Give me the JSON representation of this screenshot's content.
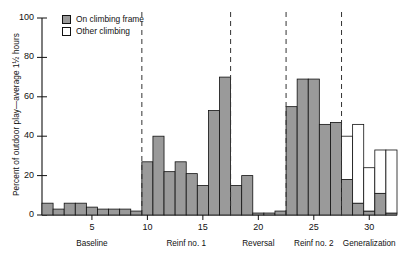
{
  "chart_data": {
    "type": "bar",
    "title": "",
    "xlabel": "",
    "ylabel": "Percent of outdoor play—average 1½ hours",
    "ylim": [
      0,
      100
    ],
    "yticks": [
      0,
      20,
      40,
      60,
      80,
      100
    ],
    "xticks": [
      5,
      10,
      15,
      20,
      25,
      30
    ],
    "xlim": [
      0.5,
      32.5
    ],
    "grid": false,
    "legend_position": "top-left",
    "stacked": true,
    "series": [
      {
        "name": "On climbing frame",
        "color": "#9a9a9a",
        "values": [
          6,
          3,
          6,
          6,
          4,
          3,
          3,
          3,
          2,
          27,
          40,
          22,
          27,
          21,
          15,
          53,
          70,
          15,
          20,
          1,
          1,
          2,
          55,
          69,
          69,
          46,
          47,
          18,
          6,
          2,
          11,
          1
        ]
      },
      {
        "name": "Other climbing",
        "color": "#ffffff",
        "values": [
          0,
          0,
          0,
          0,
          0,
          0,
          0,
          0,
          0,
          0,
          0,
          0,
          0,
          0,
          0,
          0,
          0,
          0,
          0,
          0,
          0,
          0,
          0,
          0,
          0,
          0,
          0,
          22,
          40,
          22,
          22,
          32
        ]
      }
    ],
    "x": [
      1,
      2,
      3,
      4,
      5,
      6,
      7,
      8,
      9,
      10,
      11,
      12,
      13,
      14,
      15,
      16,
      17,
      18,
      19,
      20,
      21,
      22,
      23,
      24,
      25,
      26,
      27,
      28,
      29,
      30,
      31,
      32
    ],
    "phases": [
      {
        "label": "Baseline",
        "start": 1,
        "end": 9
      },
      {
        "label": "Reinf no. 1",
        "start": 10,
        "end": 17
      },
      {
        "label": "Reversal",
        "start": 18,
        "end": 22
      },
      {
        "label": "Reinf no. 2",
        "start": 23,
        "end": 27
      },
      {
        "label": "Generalization",
        "start": 28,
        "end": 32
      }
    ],
    "phase_dividers": [
      9.5,
      17.5,
      22.5,
      27.5
    ]
  },
  "legend": {
    "items": [
      {
        "label": "On climbing frame",
        "swatch": "gray-filled-square"
      },
      {
        "label": "Other climbing",
        "swatch": "white-open-square"
      }
    ]
  },
  "axes": {
    "y_label": "Percent of outdoor play—average 1½ hours",
    "y_tick_labels": [
      "0",
      "20",
      "40",
      "60",
      "80",
      "100"
    ],
    "x_tick_labels": [
      "5",
      "10",
      "15",
      "20",
      "25",
      "30"
    ]
  }
}
